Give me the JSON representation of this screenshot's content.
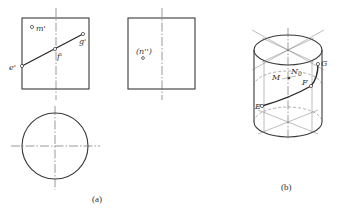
{
  "figure": {
    "caption_a": "(a)",
    "caption_b": "(b)",
    "front_view": {
      "labels": {
        "m": "m'",
        "e": "e'",
        "f": "f'",
        "g": "g'"
      },
      "points": {
        "m": [
          32,
          27
        ],
        "e": [
          22,
          66
        ],
        "f": [
          55,
          49
        ],
        "g": [
          83,
          34
        ]
      },
      "rect": {
        "x": 22,
        "y": 18,
        "w": 67,
        "h": 71
      }
    },
    "side_view": {
      "labels": {
        "n": "(n'')"
      },
      "points": {
        "n": [
          143,
          57
        ]
      },
      "rect": {
        "x": 128,
        "y": 18,
        "w": 67,
        "h": 71
      }
    },
    "top_view": {
      "circle": {
        "cx": 55,
        "cy": 146,
        "r": 33
      }
    },
    "isometric_view": {
      "labels": {
        "M": "M",
        "N0": "N",
        "N0_sub": "0",
        "F": "F",
        "G": "G",
        "E": "E"
      },
      "points": {
        "G": [
          318,
          64
        ],
        "F": [
          311,
          86
        ],
        "E": [
          262,
          106
        ],
        "M": [
          289,
          78
        ]
      }
    }
  }
}
